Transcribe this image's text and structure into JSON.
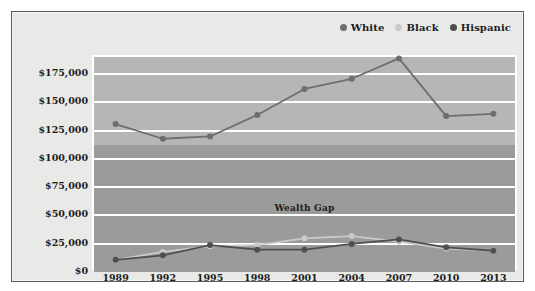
{
  "top_caption": "",
  "legend": {
    "position": "top-right",
    "items": [
      {
        "label": "White",
        "color": "#6e6e6e",
        "name": "legend-item-white"
      },
      {
        "label": "Black",
        "color": "#cacac8",
        "name": "legend-item-black"
      },
      {
        "label": "Hispanic",
        "color": "#4f4f4f",
        "name": "legend-item-hispanic"
      }
    ]
  },
  "annotation": {
    "wealth_gap_label": "Wealth Gap"
  },
  "colors": {
    "plot_background": "#b6b6b4",
    "gap_band": "#9b9b99",
    "card_background": "#e9e9e7",
    "gridline": "#ffffff",
    "card_border": "#5d5d5d",
    "white_series": "#6e6e6e",
    "black_series": "#cacac8",
    "hispanic_series": "#4f4f4f"
  },
  "chart_data": {
    "type": "line",
    "title": "",
    "subtitle": "",
    "xlabel": "",
    "ylabel": "",
    "categories": [
      "1989",
      "1992",
      "1995",
      "1998",
      "2001",
      "2004",
      "2007",
      "2010",
      "2013"
    ],
    "ytick_labels": [
      "$0",
      "$25,000",
      "$50,000",
      "$75,000",
      "$100,000",
      "$125,000",
      "$150,000",
      "$175,000"
    ],
    "ytick_values": [
      0,
      25000,
      50000,
      75000,
      100000,
      125000,
      150000,
      175000
    ],
    "ylim": [
      0,
      190000
    ],
    "grid": true,
    "legend_position": "top-right",
    "annotations": [
      {
        "text": "Wealth Gap",
        "band_from": 0,
        "band_to": 112000
      }
    ],
    "series": [
      {
        "name": "White",
        "color": "#6e6e6e",
        "values": [
          129000,
          116000,
          118000,
          137000,
          160000,
          169000,
          187000,
          136000,
          138000
        ]
      },
      {
        "name": "Black",
        "color": "#cacac8",
        "values": [
          9000,
          16000,
          21000,
          22000,
          28000,
          30000,
          25000,
          19000,
          17000
        ]
      },
      {
        "name": "Hispanic",
        "color": "#4f4f4f",
        "values": [
          9000,
          13000,
          22000,
          18000,
          18000,
          23000,
          27000,
          20000,
          17000
        ]
      }
    ]
  }
}
